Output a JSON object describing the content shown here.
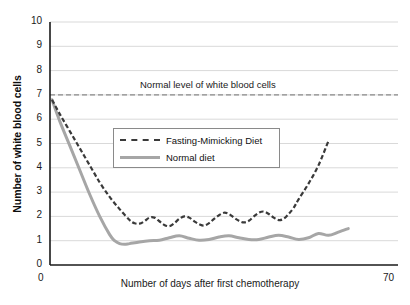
{
  "chart_data": {
    "type": "line",
    "title": "",
    "xlabel": "Number of days after first chemotherapy",
    "ylabel": "Number of white blood cells",
    "xlim": [
      0,
      70
    ],
    "ylim": [
      0,
      10
    ],
    "grid": true,
    "y_ticks": [
      "10",
      "9",
      "8",
      "7",
      "6",
      "5",
      "4",
      "3",
      "2",
      "1",
      "0"
    ],
    "x_ticks": [
      "0",
      "70"
    ],
    "legend_position": "center-left-inside",
    "annotations": [
      {
        "name": "normal-level",
        "text": "Normal level of white blood cells",
        "value": 7,
        "style": "dashed-horizontal-line"
      }
    ],
    "series": [
      {
        "name": "Fasting-Mimicking Diet",
        "style": "dashed",
        "color": "#3a3a3a",
        "x": [
          0.4,
          2,
          4,
          6,
          8,
          10,
          12,
          14,
          16,
          17,
          18,
          19,
          20,
          21,
          22,
          23,
          24,
          25,
          26,
          27,
          28,
          29,
          30,
          31,
          32,
          33,
          34,
          35,
          36,
          37,
          38,
          39,
          40,
          41,
          42,
          43,
          44,
          45,
          46,
          47,
          48,
          49,
          50,
          52,
          54,
          56
        ],
        "y": [
          6.8,
          6.2,
          5.5,
          4.8,
          4.1,
          3.4,
          2.8,
          2.3,
          1.85,
          1.72,
          1.7,
          1.8,
          1.95,
          1.95,
          1.8,
          1.65,
          1.6,
          1.72,
          1.9,
          2.0,
          1.95,
          1.8,
          1.68,
          1.62,
          1.72,
          1.9,
          2.05,
          2.15,
          2.1,
          1.95,
          1.82,
          1.75,
          1.82,
          2.0,
          2.15,
          2.2,
          2.1,
          1.95,
          1.85,
          1.9,
          2.1,
          2.35,
          2.7,
          3.35,
          4.1,
          5.1
        ]
      },
      {
        "name": "Normal diet",
        "style": "solid",
        "color": "#a6a6a6",
        "x": [
          0.4,
          2,
          4,
          6,
          8,
          10,
          12,
          13,
          14,
          15,
          16,
          18,
          20,
          22,
          24,
          26,
          28,
          30,
          32,
          34,
          36,
          38,
          40,
          42,
          44,
          46,
          48,
          50,
          52,
          54,
          56,
          58,
          60
        ],
        "y": [
          6.8,
          5.9,
          4.9,
          3.9,
          2.9,
          2.0,
          1.25,
          1.0,
          0.88,
          0.85,
          0.88,
          0.95,
          1.0,
          1.02,
          1.12,
          1.2,
          1.1,
          1.02,
          1.05,
          1.15,
          1.2,
          1.12,
          1.05,
          1.05,
          1.15,
          1.22,
          1.15,
          1.05,
          1.12,
          1.3,
          1.22,
          1.35,
          1.5
        ]
      }
    ],
    "colors": {
      "fmd_line": "#3a3a3a",
      "normal_diet_line": "#a6a6a6",
      "gridline": "#d9d9d9",
      "axis": "#1a1a1a",
      "normal_level_line": "#8a8a8a"
    }
  }
}
